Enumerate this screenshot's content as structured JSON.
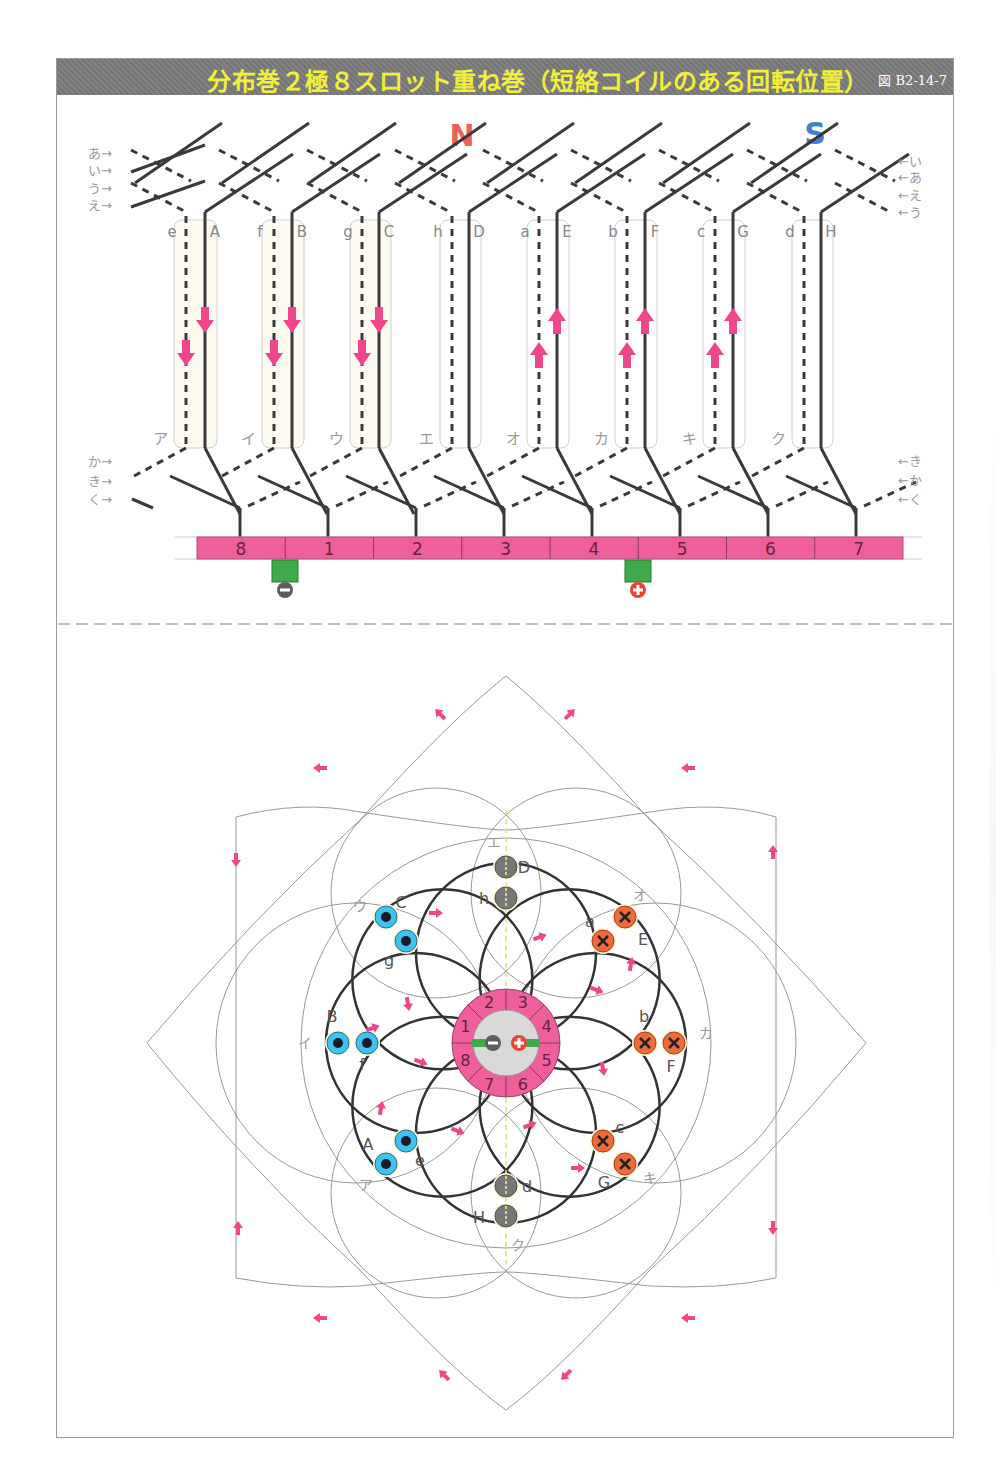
{
  "header": {
    "title": "分布巻２極８スロット重ね巻（短絡コイルのある回転位置）",
    "figure_number": "図 B2-14-7"
  },
  "top_diagram": {
    "poles": [
      {
        "label": "N",
        "color": "#f0605a"
      },
      {
        "label": "S",
        "color": "#3f7fd6"
      }
    ],
    "left_row_labels_top": [
      "あ→",
      "い→",
      "う→",
      "え→"
    ],
    "right_row_labels_top": [
      "←い",
      "←あ",
      "←え",
      "←う"
    ],
    "left_row_labels_bottom": [
      "か→",
      "き→",
      "く→"
    ],
    "right_row_labels_bottom": [
      "←き",
      "←か",
      "←く"
    ],
    "conductor_labels": [
      "e",
      "A",
      "f",
      "B",
      "g",
      "C",
      "h",
      "D",
      "a",
      "E",
      "b",
      "F",
      "c",
      "G",
      "d",
      "H"
    ],
    "coil_labels": [
      "ア",
      "イ",
      "ウ",
      "エ",
      "オ",
      "カ",
      "キ",
      "ク"
    ],
    "current_arrows": {
      "down": [
        "e",
        "A",
        "f",
        "B",
        "g",
        "C"
      ],
      "up": [
        "a",
        "E",
        "b",
        "F",
        "c",
        "G"
      ]
    },
    "commutator_segments": [
      "8",
      "1",
      "2",
      "3",
      "4",
      "5",
      "6",
      "7"
    ],
    "brushes": [
      {
        "polarity": "−",
        "position": "between 8 and 1"
      },
      {
        "polarity": "+",
        "position": "between 4 and 5"
      }
    ]
  },
  "bottom_diagram": {
    "slots": [
      {
        "pair": [
          "D",
          "h"
        ],
        "coil": "エ",
        "type": "neutral"
      },
      {
        "pair": [
          "C",
          "g"
        ],
        "coil": "ウ",
        "type": "dot"
      },
      {
        "pair": [
          "B",
          "f"
        ],
        "coil": "イ",
        "type": "dot"
      },
      {
        "pair": [
          "A",
          "e"
        ],
        "coil": "ア",
        "type": "dot"
      },
      {
        "pair": [
          "H",
          "d"
        ],
        "coil": "ク",
        "type": "neutral"
      },
      {
        "pair": [
          "G",
          "c"
        ],
        "coil": "キ",
        "type": "cross"
      },
      {
        "pair": [
          "F",
          "b"
        ],
        "coil": "カ",
        "type": "cross"
      },
      {
        "pair": [
          "E",
          "a"
        ],
        "coil": "オ",
        "type": "cross"
      }
    ],
    "commutator_segments": [
      "1",
      "2",
      "3",
      "4",
      "5",
      "6",
      "7",
      "8"
    ],
    "brush_symbols": [
      "−",
      "+"
    ]
  },
  "colors": {
    "title_bar": "#7b7b7b",
    "title_text": "#f2ef3a",
    "arrow": "#f0468a",
    "commutator": "#ee5f9c",
    "brush": "#3dab4a",
    "dot_conductor": "#3ec3ef",
    "cross_conductor": "#f06a3c",
    "neutral_conductor": "#777777"
  }
}
